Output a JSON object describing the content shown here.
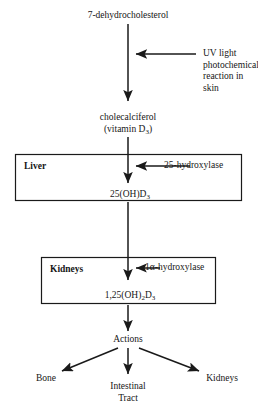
{
  "diagram": {
    "title_text": "Vitamin D metabolic pathway",
    "type": "flowchart",
    "orientation": "vertical-top-to-bottom",
    "stroke_color": "#1a1a1a",
    "background_color": "#ffffff",
    "text_color": "#161616"
  },
  "nodes": {
    "precursor": {
      "label": "7-dehydrocholesterol"
    },
    "cholecalciferol": {
      "line1": "cholecalciferol",
      "line2_prefix": "(vitamin D",
      "line2_sub": "3",
      "line2_suffix": ")"
    },
    "calcidiol": {
      "prefix": "25(OH)D",
      "sub": "3",
      "suffix": ""
    },
    "calcitriol": {
      "prefix": "1,25(OH)",
      "sub1": "2",
      "mid": "D",
      "sub2": "3"
    },
    "actions": {
      "label": "Actions"
    }
  },
  "boxes": {
    "liver": {
      "label": "Liver"
    },
    "kidneys": {
      "label": "Kidneys"
    }
  },
  "inputs": {
    "uv": {
      "line1": "UV light",
      "line2": "photochemical",
      "line3": "reaction in skin"
    },
    "hydroxylase_25": {
      "label": "25-hydroxylase"
    },
    "hydroxylase_1a": {
      "prefix": "1",
      "greek": "α",
      "suffix": "-hydroxylase"
    }
  },
  "targets": {
    "bone": {
      "label": "Bone"
    },
    "intestinal_tract": {
      "line1": "Intestinal",
      "line2": "Tract"
    },
    "kidneys": {
      "label": "Kidneys"
    }
  }
}
